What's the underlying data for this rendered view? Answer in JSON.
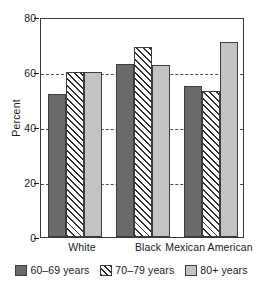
{
  "chart_data": {
    "type": "bar",
    "title": "",
    "subtitle": "",
    "xlabel": "",
    "ylabel": "Percent",
    "categories": [
      "White",
      "Black",
      "Mexican American"
    ],
    "series": [
      {
        "name": "60–69 years",
        "values": [
          52,
          63,
          55
        ],
        "color": "#6b6b6b",
        "fill": "solid"
      },
      {
        "name": "70–79 years",
        "values": [
          60,
          69,
          53
        ],
        "color": "#ffffff",
        "fill": "diagonal-hatch"
      },
      {
        "name": "80+ years",
        "values": [
          60,
          62.5,
          71
        ],
        "color": "#c3c3c3",
        "fill": "solid"
      }
    ],
    "ylim": [
      0,
      80
    ],
    "yticks": [
      0,
      20,
      40,
      60,
      80
    ],
    "ytick_labels": [
      "0",
      "20",
      "40",
      "60",
      "80"
    ],
    "gridlines": {
      "y": [
        20,
        40,
        60
      ],
      "style": "dashed",
      "color": "#4a4a4a"
    },
    "grid": true,
    "legend_position": "bottom",
    "legend_entries": [
      "60–69 years",
      "70–79 years",
      "80+ years"
    ],
    "axis_color": "#3a3a3a",
    "background": "#ffffff"
  }
}
